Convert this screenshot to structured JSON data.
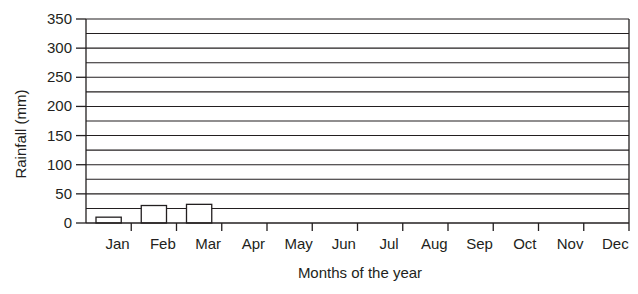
{
  "chart_data": {
    "type": "bar",
    "title": "",
    "xlabel": "Months of the year",
    "ylabel": "Rainfall (mm)",
    "categories": [
      "Jan",
      "Feb",
      "Mar",
      "Apr",
      "May",
      "Jun",
      "Jul",
      "Aug",
      "Sep",
      "Oct",
      "Nov",
      "Dec"
    ],
    "values": [
      10,
      30,
      32,
      null,
      null,
      null,
      null,
      null,
      null,
      null,
      null,
      null
    ],
    "ylim": [
      0,
      350
    ],
    "yticks": [
      0,
      50,
      100,
      150,
      200,
      250,
      300,
      350
    ],
    "minor_gridlines_every": 25,
    "grid": true,
    "legend": null
  },
  "colors": {
    "line": "#231f20",
    "bar_fill": "#ffffff",
    "text": "#231f20"
  }
}
